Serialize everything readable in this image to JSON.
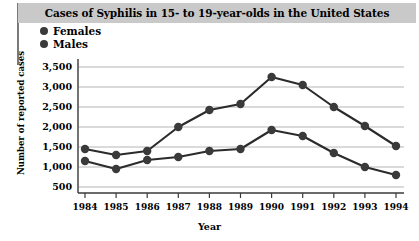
{
  "title": "Cases of Syphilis in 15- to 19-year-olds in the United States",
  "legend": {
    "items": [
      {
        "label": "Females",
        "marker": "filled-circle-icon",
        "color": "#3a3a3a"
      },
      {
        "label": "Males",
        "marker": "filled-circle-icon",
        "color": "#3a3a3a"
      }
    ]
  },
  "axes": {
    "y_title": "Number of reported cases",
    "x_title": "Year",
    "y_ticks": [
      "500",
      "1,000",
      "1,500",
      "2,000",
      "2,500",
      "3,000",
      "3,500"
    ],
    "x_ticks": [
      "1984",
      "1985",
      "1986",
      "1987",
      "1988",
      "1989",
      "1990",
      "1991",
      "1992",
      "1993",
      "1994"
    ]
  },
  "chart_data": {
    "type": "line",
    "title": "Cases of Syphilis in 15- to 19-year-olds in the United States",
    "xlabel": "Year",
    "ylabel": "Number of reported cases",
    "categories": [
      "1984",
      "1985",
      "1986",
      "1987",
      "1988",
      "1989",
      "1990",
      "1991",
      "1992",
      "1993",
      "1994"
    ],
    "x": [
      1984,
      1985,
      1986,
      1987,
      1988,
      1989,
      1990,
      1991,
      1992,
      1993,
      1994
    ],
    "series": [
      {
        "name": "Females",
        "color": "#3a3a3a",
        "values": [
          1450,
          1300,
          1400,
          2000,
          2425,
          2575,
          3250,
          3050,
          2500,
          2025,
          1525
        ]
      },
      {
        "name": "Males",
        "color": "#3a3a3a",
        "values": [
          1150,
          950,
          1175,
          1250,
          1400,
          1450,
          1925,
          1775,
          1350,
          1000,
          800
        ]
      }
    ],
    "ylim": [
      350,
      3700
    ],
    "xlim": [
      1983.6,
      1994.4
    ],
    "grid": true,
    "grid_axis": "y",
    "legend_position": "top-left",
    "y_tick_values": [
      500,
      1000,
      1500,
      2000,
      2500,
      3000,
      3500
    ]
  }
}
